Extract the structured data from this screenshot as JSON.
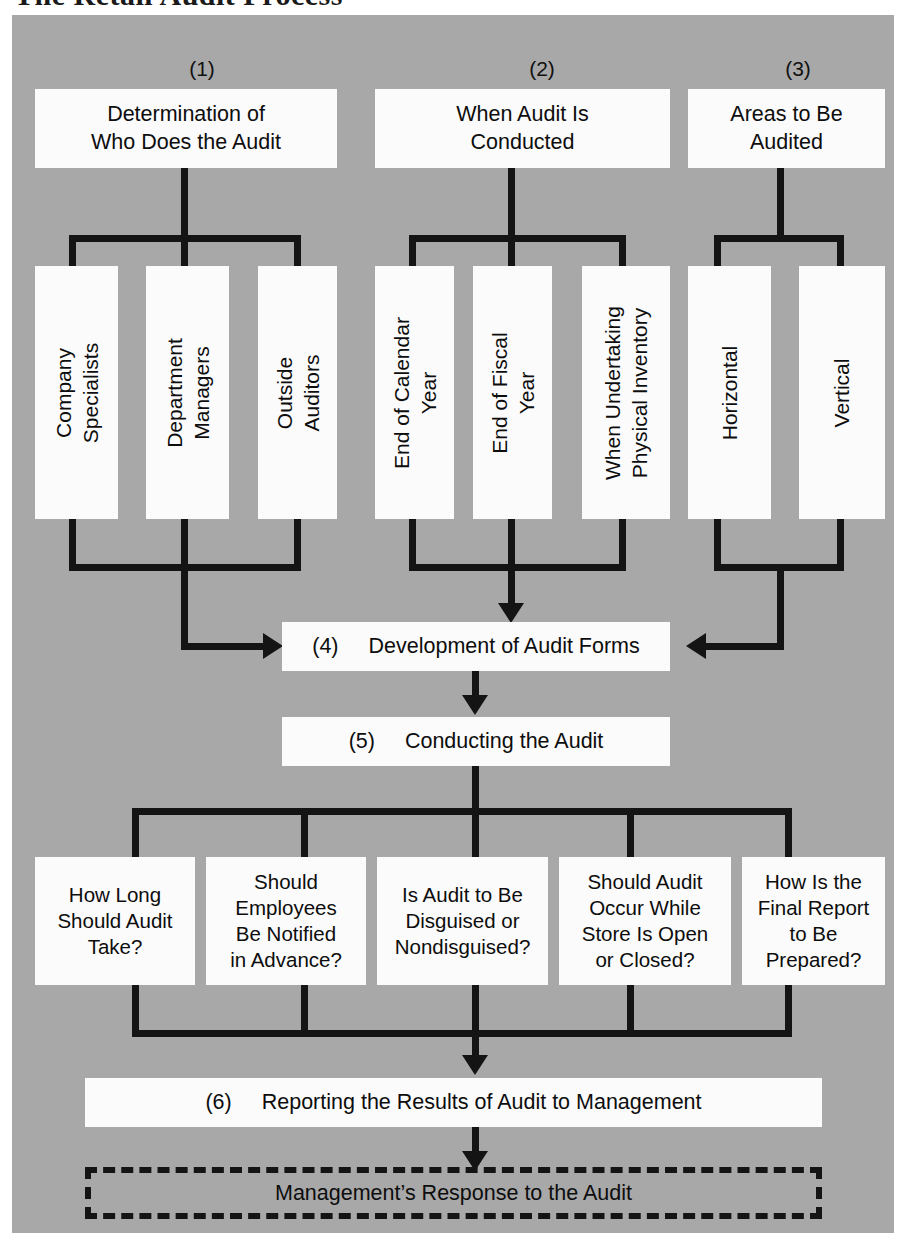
{
  "page": {
    "title": "The Retail Audit Process"
  },
  "colors": {
    "plate_bg": "#a8a8a8",
    "box_fill": "#fbfbfb",
    "line": "#141414",
    "text": "#0d0d0d"
  },
  "groups": [
    {
      "number": "(1)",
      "heading": "Determination of\nWho Does the Audit",
      "heading_line1": "Determination of",
      "heading_line2": "Who Does the Audit",
      "items": [
        {
          "line1": "Company",
          "line2": "Specialists"
        },
        {
          "line1": "Department",
          "line2": "Managers"
        },
        {
          "line1": "Outside",
          "line2": "Auditors"
        }
      ]
    },
    {
      "number": "(2)",
      "heading_line1": "When Audit Is",
      "heading_line2": "Conducted",
      "items": [
        {
          "line1": "End of Calendar",
          "line2": "Year"
        },
        {
          "line1": "End of Fiscal",
          "line2": "Year"
        },
        {
          "line1": "When Undertaking",
          "line2": "Physical Inventory"
        }
      ]
    },
    {
      "number": "(3)",
      "heading_line1": "Areas to Be",
      "heading_line2": "Audited",
      "items": [
        {
          "line1": "Horizontal",
          "line2": ""
        },
        {
          "line1": "Vertical",
          "line2": ""
        }
      ]
    }
  ],
  "stage4": {
    "number": "(4)",
    "label": "Development of Audit Forms"
  },
  "stage5": {
    "number": "(5)",
    "label": "Conducting the Audit"
  },
  "questions": [
    {
      "line1": "How Long",
      "line2": "Should Audit",
      "line3": "Take?",
      "line4": ""
    },
    {
      "line1": "Should",
      "line2": "Employees",
      "line3": "Be Notified",
      "line4": "in Advance?"
    },
    {
      "line1": "Is Audit to Be",
      "line2": "Disguised or",
      "line3": "Nondisguised?",
      "line4": ""
    },
    {
      "line1": "Should Audit",
      "line2": "Occur While",
      "line3": "Store Is Open",
      "line4": "or Closed?"
    },
    {
      "line1": "How Is the",
      "line2": "Final Report",
      "line3": "to Be",
      "line4": "Prepared?"
    }
  ],
  "stage6": {
    "number": "(6)",
    "label": "Reporting the Results of Audit to Management"
  },
  "stage7": {
    "label": "Management’s Response to the Audit"
  }
}
